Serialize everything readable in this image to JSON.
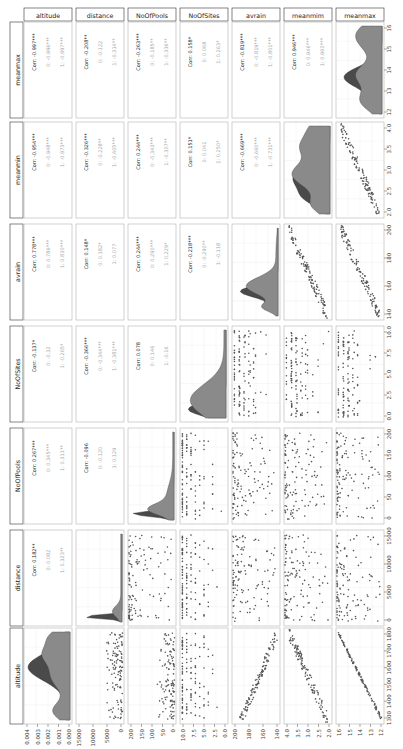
{
  "chart_data": {
    "type": "scatter",
    "title": "",
    "variables": [
      "altitude",
      "distance",
      "NoOfPools",
      "NoOfSites",
      "avrain",
      "meanmim",
      "meanmax"
    ],
    "row_labels": [
      "meanmax",
      "meanmin",
      "avrain",
      "NoOfSites",
      "NoOfPools",
      "distance",
      "altitude"
    ],
    "groups": [
      "0",
      "1"
    ],
    "group_colors": {
      "0": "#4d4d4d",
      "1": "#8c8c8c"
    },
    "correlations": [
      {
        "pair": [
          "altitude",
          "meanmax"
        ],
        "corr": "Corr: -0.997***",
        "g0": "0: -0.996***",
        "g1": "1: -0.997***"
      },
      {
        "pair": [
          "distance",
          "meanmax"
        ],
        "corr": "Corr: -0.208**",
        "g0": "0: -0.122",
        "g1": "1: -0.314**"
      },
      {
        "pair": [
          "NoOfPools",
          "meanmax"
        ],
        "corr": "Corr: -0.263***",
        "g0": "0: -0.185**",
        "g1": "1: -0.336**"
      },
      {
        "pair": [
          "NoOfSites",
          "meanmax"
        ],
        "corr": "Corr: 0.158*",
        "g0": "0: 0.068",
        "g1": "1: 0.263*"
      },
      {
        "pair": [
          "avrain",
          "meanmax"
        ],
        "corr": "Corr: -0.819***",
        "g0": "0: -0.819***",
        "g1": "1: -0.801***"
      },
      {
        "pair": [
          "meanmim",
          "meanmax"
        ],
        "corr": "Corr: 0.946***",
        "g0": "0: 0.946***",
        "g1": "1: 0.960***"
      },
      {
        "pair": [
          "altitude",
          "meanmin"
        ],
        "corr": "Corr: -0.954***",
        "g0": "0: -0.948***",
        "g1": "1: -0.973***"
      },
      {
        "pair": [
          "distance",
          "meanmin"
        ],
        "corr": "Corr: -0.326***",
        "g0": "0: -0.228**",
        "g1": "1: -0.405***"
      },
      {
        "pair": [
          "NoOfPools",
          "meanmin"
        ],
        "corr": "Corr: 0.244***",
        "g0": "0: -0.343***",
        "g1": "1: -0.307**"
      },
      {
        "pair": [
          "NoOfSites",
          "meanmin"
        ],
        "corr": "Corr: 0.151*",
        "g0": "0: 0.041",
        "g1": "1: 0.250*"
      },
      {
        "pair": [
          "avrain",
          "meanmin"
        ],
        "corr": "Corr: -0.669***",
        "g0": "0: -0.660***",
        "g1": "1: -0.731***"
      },
      {
        "pair": [
          "altitude",
          "avrain"
        ],
        "corr": "Corr: 0.778***",
        "g0": "0: 0.786***",
        "g1": "1: 0.830***"
      },
      {
        "pair": [
          "distance",
          "avrain"
        ],
        "corr": "Corr: 0.148*",
        "g0": "0: 0.182*",
        "g1": "1: 0.077"
      },
      {
        "pair": [
          "NoOfPools",
          "avrain"
        ],
        "corr": "Corr: 0.244***",
        "g0": "0: 0.290***",
        "g1": "1: 0.229*"
      },
      {
        "pair": [
          "NoOfSites",
          "avrain"
        ],
        "corr": "Corr: -0.218***",
        "g0": "0: -0.290**",
        "g1": "1: -0.118"
      },
      {
        "pair": [
          "altitude",
          "NoOfSites"
        ],
        "corr": "Corr: -0.137*",
        "g0": "0: -0.32",
        "g1": "1: -0.265*"
      },
      {
        "pair": [
          "distance",
          "NoOfSites"
        ],
        "corr": "Corr: -0.366***",
        "g0": "0: -0.344***",
        "g1": "1: -0.381***"
      },
      {
        "pair": [
          "NoOfPools",
          "NoOfSites"
        ],
        "corr": "Corr: 0.078",
        "g0": "0: 0.146",
        "g1": "1: -0.16"
      },
      {
        "pair": [
          "altitude",
          "NoOfPools"
        ],
        "corr": "Corr: 0.267***",
        "g0": "0: 0.345***",
        "g1": "1: 0.311**"
      },
      {
        "pair": [
          "distance",
          "NoOfPools"
        ],
        "corr": "Corr: -0.096",
        "g0": "0: -0.120",
        "g1": "1: 0.129"
      },
      {
        "pair": [
          "altitude",
          "distance"
        ],
        "corr": "Corr: 0.182**",
        "g0": "0: 0.082",
        "g1": "1: 0.323**"
      }
    ],
    "axes": {
      "altitude": {
        "ticks": [
          "1300",
          "1400",
          "1500",
          "1600",
          "1700",
          "1800"
        ],
        "range": [
          1250,
          1820
        ]
      },
      "altitude_density": {
        "ticks": [
          "0.004",
          "0.003",
          "0.002",
          "0.001",
          "0.000"
        ],
        "range": [
          0,
          0.0045
        ]
      },
      "distance": {
        "ticks": [
          "15000",
          "10000",
          "5000",
          "0"
        ],
        "range": [
          0,
          17000
        ]
      },
      "NoOfPools": {
        "ticks": [
          "200",
          "150",
          "100",
          "50",
          "0"
        ],
        "range": [
          0,
          235
        ]
      },
      "NoOfSites": {
        "ticks": [
          "10.0",
          "7.5",
          "5.0",
          "2.5",
          "0.0"
        ],
        "range": [
          0,
          10.5
        ]
      },
      "avrain": {
        "ticks": [
          "200",
          "180",
          "160",
          "140"
        ],
        "range": [
          128,
          205
        ]
      },
      "meanmin": {
        "ticks": [
          "4.0",
          "3.5",
          "3.0",
          "2.5",
          "2.0"
        ],
        "range": [
          2.0,
          4.25
        ]
      },
      "meanmax": {
        "ticks": [
          "16",
          "15",
          "14",
          "13",
          "12"
        ],
        "range": [
          11.6,
          16.2
        ]
      }
    },
    "legend": "none",
    "grid": true
  },
  "strips": {
    "columns": [
      "altitude",
      "distance",
      "NoOfPools",
      "NoOfSites",
      "avrain",
      "meanmim",
      "meanmax"
    ],
    "rows": [
      "meanmax",
      "meanmin",
      "avrain",
      "NoOfSites",
      "NoOfPools",
      "distance",
      "altitude"
    ]
  },
  "ticks": {
    "right": {
      "meanmax": [
        "16",
        "15",
        "14",
        "13",
        "12"
      ],
      "meanmin": [
        "4.0",
        "3.5",
        "3.0",
        "2.5",
        "2.0"
      ],
      "avrain": [
        "200",
        "180",
        "160",
        "140"
      ],
      "NoOfSites": [
        "10.0",
        "7.5",
        "5.0",
        "2.5",
        "0.0"
      ],
      "NoOfPools": [
        "200",
        "150",
        "100",
        "50",
        "0"
      ],
      "distance": [
        "15000",
        "10000",
        "5000",
        "0"
      ],
      "altitude": [
        "1800",
        "1700",
        "1600",
        "1500",
        "1400",
        "1300"
      ]
    },
    "bottom": {
      "altitude": [
        "0.004",
        "0.003",
        "0.002",
        "0.001",
        "0.000"
      ],
      "distance": [
        "15000",
        "10000",
        "5000",
        "0"
      ],
      "NoOfPools": [
        "200",
        "150",
        "100",
        "50",
        "0"
      ],
      "NoOfSites": [
        "10.0",
        "7.5",
        "5.0",
        "2.5",
        "0.0"
      ],
      "avrain": [
        "200",
        "180",
        "160",
        "140"
      ],
      "meanmim": [
        "4.0",
        "3.5",
        "3.0",
        "2.5",
        "2.0"
      ],
      "meanmax": [
        "16",
        "15",
        "14",
        "13",
        "12"
      ]
    }
  },
  "colors": {
    "panel_border": "#bdbdbd",
    "grid": "#ececec",
    "strip_border": "#333333",
    "density_dark": "#4a4a4a",
    "density_light": "#8a8a8a",
    "point": "#555555",
    "corr_title": "#222222",
    "corr_group": "#a8a8a8"
  }
}
